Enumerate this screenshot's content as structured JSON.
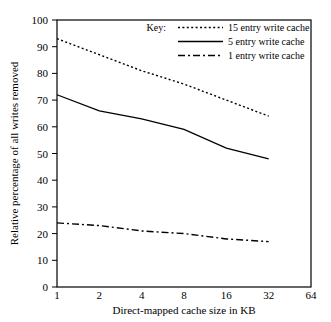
{
  "chart_data": {
    "type": "line",
    "title": "",
    "xlabel": "Direct-mapped cache size in KB",
    "ylabel": "Relative percentage of all writes removed",
    "xscale": "log2",
    "x": [
      1,
      2,
      4,
      8,
      16,
      32,
      64
    ],
    "xticklabels": [
      "1",
      "2",
      "4",
      "8",
      "16",
      "32",
      "64"
    ],
    "yticklabels": [
      "0",
      "10",
      "20",
      "30",
      "40",
      "50",
      "60",
      "70",
      "80",
      "90",
      "100"
    ],
    "ylim": [
      0,
      100
    ],
    "xlim": [
      1,
      64
    ],
    "grid": false,
    "legend_position": "top-right-inside",
    "legend_title": "Key:",
    "series": [
      {
        "name": "15 entry write cache",
        "style": "dotted",
        "x": [
          1,
          2,
          4,
          8,
          16,
          32
        ],
        "values": [
          93,
          87,
          81,
          76,
          70,
          64
        ]
      },
      {
        "name": "5 entry write cache",
        "style": "solid",
        "x": [
          1,
          2,
          4,
          8,
          16,
          32
        ],
        "values": [
          72,
          66,
          63,
          59,
          52,
          48
        ]
      },
      {
        "name": "1 entry write cache",
        "style": "dashdot",
        "x": [
          1,
          2,
          4,
          8,
          16,
          32
        ],
        "values": [
          24,
          23,
          21,
          20,
          18,
          17
        ]
      }
    ],
    "colors": {
      "axis": "#000000",
      "series": "#000000",
      "background": "#ffffff"
    }
  }
}
